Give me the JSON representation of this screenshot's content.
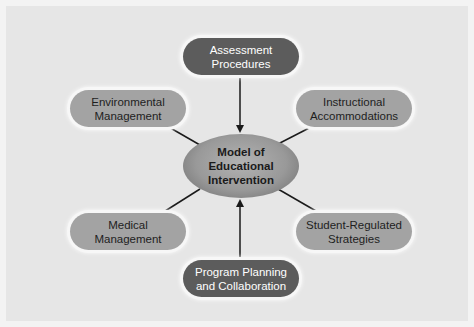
{
  "diagram": {
    "center": {
      "label_lines": [
        "Model of",
        "Educational",
        "Intervention"
      ]
    },
    "nodes": [
      {
        "id": "assessment",
        "lines": [
          "Assessment",
          "Procedures"
        ],
        "style": "dark",
        "connector": "arrow-to-center"
      },
      {
        "id": "environmental",
        "lines": [
          "Environmental",
          "Management"
        ],
        "style": "light",
        "connector": "line"
      },
      {
        "id": "instructional",
        "lines": [
          "Instructional",
          "Accommodations"
        ],
        "style": "light",
        "connector": "line"
      },
      {
        "id": "medical",
        "lines": [
          "Medical",
          "Management"
        ],
        "style": "light",
        "connector": "line"
      },
      {
        "id": "student",
        "lines": [
          "Student-Regulated",
          "Strategies"
        ],
        "style": "light",
        "connector": "line"
      },
      {
        "id": "program",
        "lines": [
          "Program Planning",
          "and Collaboration"
        ],
        "style": "dark",
        "connector": "arrow-to-center"
      }
    ],
    "colors": {
      "background": "#e6e6e6",
      "dark_node": "#5c5c5c",
      "light_node": "#a3a3a3",
      "connector": "#1a1a1a"
    }
  }
}
